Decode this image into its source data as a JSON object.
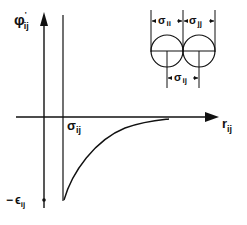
{
  "diagram": {
    "type": "potential-function",
    "y_axis": {
      "symbol": "φ",
      "prime": "'",
      "subscript": "ij"
    },
    "x_axis": {
      "symbol": "r",
      "subscript": "ij"
    },
    "sigma_label": {
      "symbol": "σ",
      "subscript": "ij"
    },
    "epsilon_label": {
      "prefix": "−",
      "symbol": "ϵ",
      "subscript": "ij"
    },
    "inset": {
      "left_diameter": {
        "symbol": "σ",
        "subscript": "ii"
      },
      "right_diameter": {
        "symbol": "σ",
        "subscript": "jj"
      },
      "center_distance": {
        "symbol": "σ",
        "subscript": "ij"
      }
    }
  },
  "colors": {
    "ink": "#111111",
    "background": "#ffffff"
  }
}
